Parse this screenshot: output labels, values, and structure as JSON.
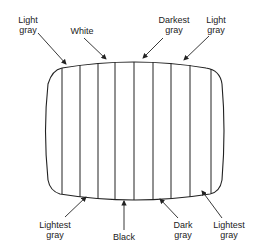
{
  "diagram": {
    "type": "crt-screen-gray-band-pattern",
    "stripes_count": 10,
    "top_labels": [
      {
        "line1": "Light",
        "line2": "gray"
      },
      {
        "line1": "White",
        "line2": ""
      },
      {
        "line1": "Darkest",
        "line2": "gray"
      },
      {
        "line1": "Light",
        "line2": "gray"
      }
    ],
    "bottom_labels": [
      {
        "line1": "Lightest",
        "line2": "gray"
      },
      {
        "line1": "Black",
        "line2": ""
      },
      {
        "line1": "Dark",
        "line2": "gray"
      },
      {
        "line1": "Lightest",
        "line2": "gray"
      }
    ]
  }
}
